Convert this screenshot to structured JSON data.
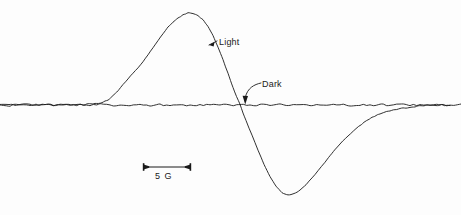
{
  "figure": {
    "type": "epr-first-derivative-spectrum",
    "background_color": "#fdfdfd",
    "trace_color": "#1a1a1a"
  },
  "annotations": {
    "light_label": "Light",
    "dark_label": "Dark",
    "scale_bar_label": "5 G"
  },
  "scale_bar": {
    "value": 5,
    "unit": "G",
    "unit_name": "Gauss",
    "label": "5 G",
    "x_start": 143,
    "x_end": 191,
    "y": 167
  },
  "chart_data": {
    "type": "line",
    "title": "",
    "subtitle": "",
    "xlabel": "",
    "ylabel": "",
    "grid": false,
    "legend_position": "inline-annotations",
    "axis_visible": false,
    "x_axis_units": "Gauss (relative magnetic field)",
    "y_axis_units": "dChi''/dB (first derivative EPR signal, arbitrary units)",
    "scale_reference": {
      "label": "5 G",
      "pixels_per_unit": 9.6,
      "gauss_per_division": 5
    },
    "baseline_y_pixel": 105,
    "series": [
      {
        "name": "Light",
        "label": "Light",
        "color": "#1a1a1a",
        "description": "Photo-induced EPR signal; antisymmetric first-derivative lineshape with positive lobe then negative lobe",
        "peak_amplitude": 1.0,
        "trough_amplitude": -0.98,
        "peak_x_pixel": 188,
        "peak_y_pixel": 13,
        "trough_x_pixel": 286,
        "trough_y_pixel": 197,
        "zero_crossing_x_pixel": 240,
        "peak_to_peak_width_gauss": 10.2,
        "points": [
          [
            0,
            0.005
          ],
          [
            12,
            0.002
          ],
          [
            24,
            0.006
          ],
          [
            36,
            0.001
          ],
          [
            48,
            0.004
          ],
          [
            60,
            0.0
          ],
          [
            72,
            0.006
          ],
          [
            84,
            0.003
          ],
          [
            95,
            0.012
          ],
          [
            102,
            0.02
          ],
          [
            108,
            0.05
          ],
          [
            113,
            0.1
          ],
          [
            118,
            0.155
          ],
          [
            123,
            0.22
          ],
          [
            128,
            0.285
          ],
          [
            133,
            0.345
          ],
          [
            138,
            0.405
          ],
          [
            143,
            0.47
          ],
          [
            148,
            0.545
          ],
          [
            153,
            0.625
          ],
          [
            158,
            0.7
          ],
          [
            163,
            0.775
          ],
          [
            168,
            0.845
          ],
          [
            173,
            0.9
          ],
          [
            178,
            0.945
          ],
          [
            183,
            0.98
          ],
          [
            188,
            1.0
          ],
          [
            193,
            0.995
          ],
          [
            198,
            0.97
          ],
          [
            203,
            0.925
          ],
          [
            208,
            0.855
          ],
          [
            213,
            0.755
          ],
          [
            218,
            0.63
          ],
          [
            223,
            0.49
          ],
          [
            228,
            0.345
          ],
          [
            233,
            0.19
          ],
          [
            240,
            0.0
          ],
          [
            246,
            -0.17
          ],
          [
            252,
            -0.33
          ],
          [
            258,
            -0.49
          ],
          [
            264,
            -0.645
          ],
          [
            270,
            -0.775
          ],
          [
            276,
            -0.88
          ],
          [
            282,
            -0.955
          ],
          [
            288,
            -0.98
          ],
          [
            294,
            -0.965
          ],
          [
            300,
            -0.925
          ],
          [
            306,
            -0.865
          ],
          [
            312,
            -0.795
          ],
          [
            318,
            -0.715
          ],
          [
            325,
            -0.62
          ],
          [
            332,
            -0.525
          ],
          [
            340,
            -0.425
          ],
          [
            348,
            -0.335
          ],
          [
            356,
            -0.255
          ],
          [
            364,
            -0.19
          ],
          [
            372,
            -0.135
          ],
          [
            380,
            -0.095
          ],
          [
            390,
            -0.06
          ],
          [
            400,
            -0.035
          ],
          [
            412,
            -0.018
          ],
          [
            424,
            -0.008
          ],
          [
            436,
            -0.003
          ],
          [
            450,
            0.0
          ]
        ]
      },
      {
        "name": "Dark",
        "label": "Dark",
        "color": "#1a1a1a",
        "description": "Dark control trace; flat noisy baseline with no resonance signal",
        "peak_amplitude": 0.012,
        "trough_amplitude": -0.012,
        "points": [
          [
            0,
            0.004
          ],
          [
            10,
            -0.006
          ],
          [
            20,
            0.005
          ],
          [
            30,
            -0.004
          ],
          [
            40,
            0.006
          ],
          [
            50,
            -0.005
          ],
          [
            60,
            0.003
          ],
          [
            70,
            -0.006
          ],
          [
            80,
            0.005
          ],
          [
            90,
            -0.003
          ],
          [
            100,
            0.006
          ],
          [
            110,
            -0.005
          ],
          [
            120,
            0.004
          ],
          [
            130,
            -0.006
          ],
          [
            140,
            0.005
          ],
          [
            150,
            -0.004
          ],
          [
            160,
            0.006
          ],
          [
            170,
            -0.005
          ],
          [
            180,
            0.003
          ],
          [
            190,
            -0.006
          ],
          [
            200,
            0.005
          ],
          [
            210,
            -0.004
          ],
          [
            220,
            0.006
          ],
          [
            230,
            -0.005
          ],
          [
            240,
            0.004
          ],
          [
            250,
            -0.006
          ],
          [
            260,
            0.005
          ],
          [
            270,
            -0.003
          ],
          [
            280,
            0.006
          ],
          [
            290,
            -0.005
          ],
          [
            300,
            0.004
          ],
          [
            310,
            -0.006
          ],
          [
            320,
            0.005
          ],
          [
            330,
            -0.004
          ],
          [
            340,
            0.006
          ],
          [
            350,
            -0.005
          ],
          [
            360,
            0.003
          ],
          [
            370,
            -0.006
          ],
          [
            380,
            0.005
          ],
          [
            390,
            -0.004
          ],
          [
            400,
            0.006
          ],
          [
            410,
            -0.005
          ],
          [
            420,
            0.004
          ],
          [
            430,
            -0.006
          ],
          [
            440,
            0.005
          ],
          [
            450,
            -0.003
          ],
          [
            461,
            0.004
          ]
        ]
      }
    ]
  }
}
